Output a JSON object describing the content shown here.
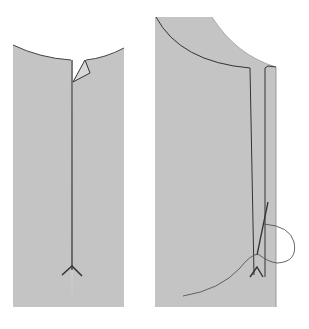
{
  "figure": {
    "colors": {
      "background": "#ffffff",
      "fabric": "#c4c4c4",
      "line": "#3a3a3a",
      "thread": "#555555"
    },
    "panels": [
      {
        "name": "left-panel",
        "label": ""
      },
      {
        "name": "right-panel",
        "label": ""
      }
    ]
  }
}
